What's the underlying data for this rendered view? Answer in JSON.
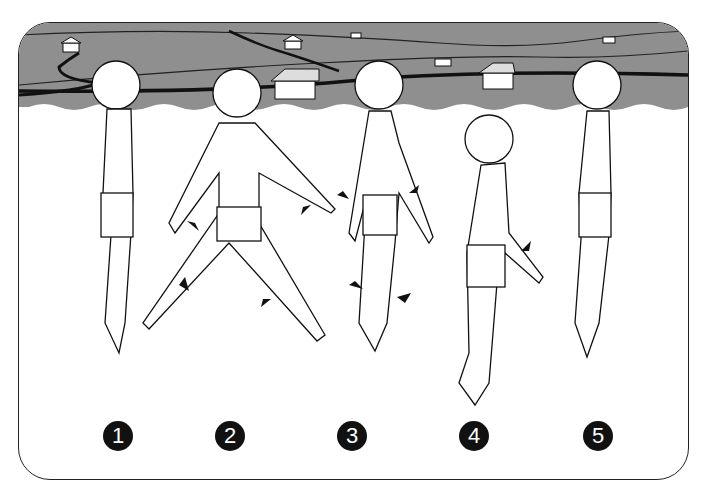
{
  "illustration": {
    "description": "Five-step swimming/water exercise sequence: a boy in swim trunks standing in water, with a landscape of hills, roads and houses in the background",
    "colors": {
      "sky_land": "#8f8f8f",
      "water": "#ffffff",
      "outline": "#111111",
      "badge": "#111111",
      "badge_text": "#ffffff"
    },
    "steps": [
      {
        "number": "1",
        "pose": "standing upright, arms at sides"
      },
      {
        "number": "2",
        "pose": "wide stride, arms spread, arrows indicating motion"
      },
      {
        "number": "3",
        "pose": "knees bent, arrows pointing inward"
      },
      {
        "number": "4",
        "pose": "leaning forward, arms extended, arrow at arm"
      },
      {
        "number": "5",
        "pose": "standing upright, arms at sides"
      }
    ]
  }
}
